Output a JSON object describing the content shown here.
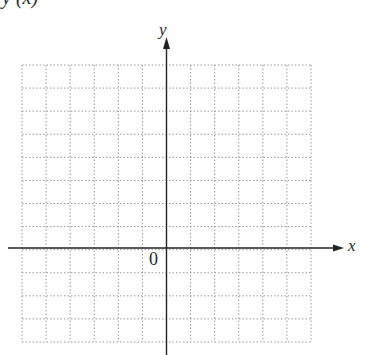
{
  "header": {
    "cut_title": "y (x)"
  },
  "axes": {
    "x_label": "x",
    "y_label": "y",
    "origin_label": "0"
  },
  "grid": {
    "columns": 12,
    "rows": 12,
    "rows_above_axis": 8,
    "rows_below_axis": 4,
    "cols_left_of_axis": 6,
    "cols_right_of_axis": 6,
    "line_style": "dotted",
    "grid_color": "#9a9a9a",
    "axis_color": "#222222"
  },
  "chart_data": {
    "type": "scatter",
    "title": "",
    "xlabel": "x",
    "ylabel": "y",
    "xlim": [
      -6,
      6
    ],
    "ylim": [
      -4,
      8
    ],
    "grid": true,
    "series": [],
    "annotations": [
      "0"
    ]
  }
}
